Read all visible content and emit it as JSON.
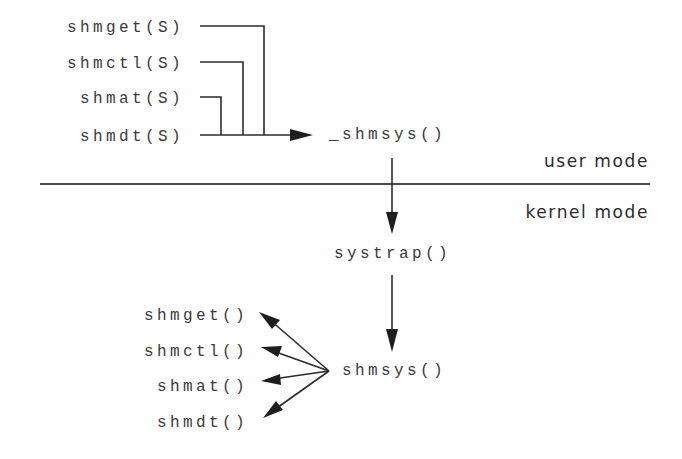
{
  "user_calls": [
    {
      "label": "shmget(S)"
    },
    {
      "label": "shmctl(S)"
    },
    {
      "label": "shmat(S)"
    },
    {
      "label": "shmdt(S)"
    }
  ],
  "library_entry": {
    "label": "_shmsys()"
  },
  "mode_labels": {
    "user": "user mode",
    "kernel": "kernel mode"
  },
  "trap_handler": {
    "label": "systrap()"
  },
  "dispatcher": {
    "label": "shmsys()"
  },
  "kernel_functions": [
    {
      "label": "shmget()"
    },
    {
      "label": "shmctl()"
    },
    {
      "label": "shmat()"
    },
    {
      "label": "shmdt()"
    }
  ],
  "colors": {
    "line": "#2b2b2b",
    "text": "#3a3a3a",
    "background": "#ffffff"
  }
}
